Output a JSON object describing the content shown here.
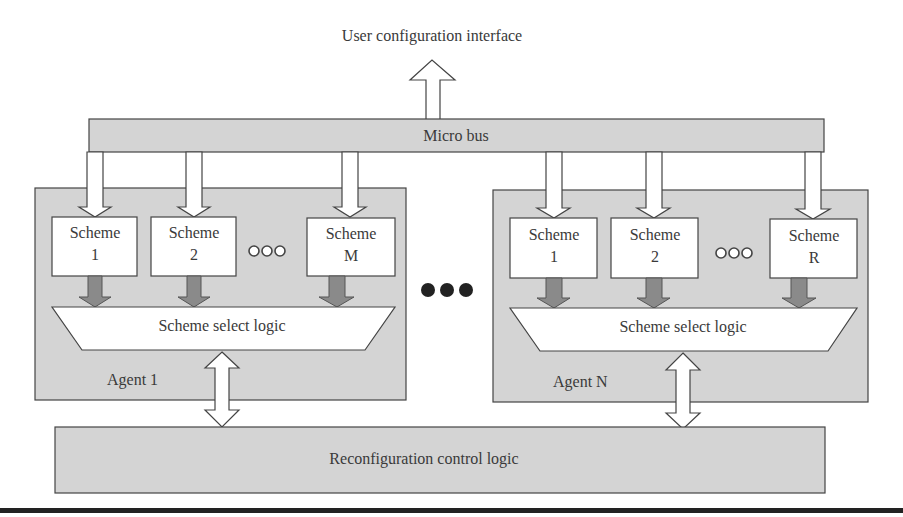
{
  "diagram": {
    "title_top": "User configuration interface",
    "bus_label": "Micro bus",
    "bottom_label": "Reconfiguration control logic",
    "between_agents_ellipsis": "●●●",
    "agents": [
      {
        "name": "Agent 1",
        "schemes": [
          {
            "line1": "Scheme",
            "line2": "1"
          },
          {
            "line1": "Scheme",
            "line2": "2"
          },
          {
            "line1": "Scheme",
            "line2": "M"
          }
        ],
        "ellipsis": "○○○",
        "select_logic": "Scheme select logic"
      },
      {
        "name": "Agent N",
        "schemes": [
          {
            "line1": "Scheme",
            "line2": "1"
          },
          {
            "line1": "Scheme",
            "line2": "2"
          },
          {
            "line1": "Scheme",
            "line2": "R"
          }
        ],
        "ellipsis": "○○○",
        "select_logic": "Scheme select logic"
      }
    ],
    "colors": {
      "block_fill": "#d4d4d4",
      "box_fill": "#ffffff",
      "stroke": "#444444",
      "dark_arrow": "#8a8a8a",
      "rule": "#222222"
    }
  }
}
